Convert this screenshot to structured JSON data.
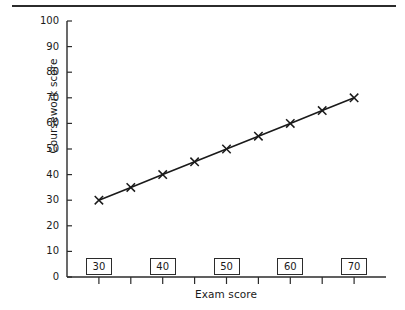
{
  "figure": {
    "has_top_rule": true,
    "background_color": "#ffffff",
    "ink_color": "#2b2b2b"
  },
  "chart_data": {
    "type": "line",
    "title": "",
    "subtitle": "",
    "xlabel": "Exam score",
    "ylabel": "Coursework score",
    "xlim": [
      25,
      75
    ],
    "ylim": [
      0,
      100
    ],
    "grid": false,
    "legend": null,
    "marker": "x",
    "line_color": "#1a1a1a",
    "x": [
      30,
      35,
      40,
      45,
      50,
      55,
      60,
      65,
      70
    ],
    "values": [
      30,
      35,
      40,
      45,
      50,
      55,
      60,
      65,
      70
    ],
    "series": [
      {
        "name": "Coursework vs Exam",
        "x": [
          30,
          35,
          40,
          45,
          50,
          55,
          60,
          65,
          70
        ],
        "values": [
          30,
          35,
          40,
          45,
          50,
          55,
          60,
          65,
          70
        ]
      }
    ],
    "y_ticks": [
      0,
      10,
      20,
      30,
      40,
      50,
      60,
      70,
      80,
      90,
      100
    ],
    "y_tick_labels": [
      "0",
      "10",
      "20",
      "30",
      "40",
      "50",
      "60",
      "70",
      "80",
      "90",
      "100"
    ],
    "x_ticks": [
      30,
      35,
      40,
      45,
      50,
      55,
      60,
      65,
      70
    ],
    "x_tick_labels_boxed": [
      "30",
      "40",
      "50",
      "60",
      "70"
    ],
    "x_boxed_tick_values": [
      30,
      40,
      50,
      60,
      70
    ],
    "annotations": []
  }
}
